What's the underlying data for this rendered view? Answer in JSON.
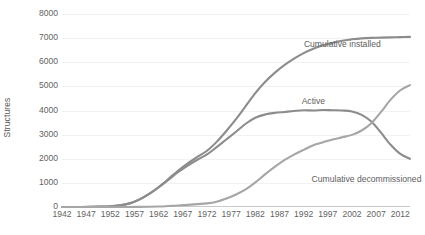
{
  "chart_data": {
    "type": "line",
    "title": "",
    "xlabel": "",
    "ylabel": "Structures",
    "xlim": [
      1942,
      2014
    ],
    "ylim": [
      0,
      8000
    ],
    "grid": true,
    "legend_position": "inline-labels",
    "y_ticks": [
      "0",
      "1000",
      "2000",
      "3000",
      "4000",
      "5000",
      "6000",
      "7000",
      "8000"
    ],
    "y_tick_values": [
      0,
      1000,
      2000,
      3000,
      4000,
      5000,
      6000,
      7000,
      8000
    ],
    "x_ticks": [
      "1942",
      "1947",
      "1952",
      "1957",
      "1962",
      "1967",
      "1972",
      "1977",
      "1982",
      "1987",
      "1992",
      "1997",
      "2002",
      "2007",
      "2012"
    ],
    "x_tick_values": [
      1942,
      1947,
      1952,
      1957,
      1962,
      1967,
      1972,
      1977,
      1982,
      1987,
      1992,
      1997,
      2002,
      2007,
      2012
    ],
    "x": [
      1942,
      1944,
      1946,
      1948,
      1950,
      1952,
      1954,
      1956,
      1958,
      1960,
      1962,
      1964,
      1966,
      1968,
      1970,
      1972,
      1974,
      1976,
      1978,
      1980,
      1982,
      1984,
      1986,
      1988,
      1990,
      1992,
      1994,
      1996,
      1998,
      2000,
      2002,
      2004,
      2006,
      2008,
      2010,
      2012,
      2014
    ],
    "series": [
      {
        "name": "Cumulative installed",
        "color": "#8c8c8c",
        "values": [
          0,
          0,
          0,
          5,
          15,
          30,
          70,
          150,
          310,
          540,
          830,
          1160,
          1500,
          1810,
          2080,
          2330,
          2700,
          3150,
          3640,
          4180,
          4720,
          5180,
          5560,
          5880,
          6150,
          6380,
          6560,
          6700,
          6810,
          6890,
          6950,
          6990,
          7010,
          7020,
          7030,
          7040,
          7050
        ],
        "label_x": 2000,
        "label_y": 6750
      },
      {
        "name": "Active",
        "color": "#8c8c8c",
        "values": [
          0,
          0,
          0,
          5,
          15,
          30,
          70,
          150,
          305,
          530,
          810,
          1120,
          1440,
          1720,
          1960,
          2180,
          2480,
          2800,
          3120,
          3450,
          3700,
          3830,
          3900,
          3940,
          3980,
          4010,
          4000,
          4020,
          4010,
          4000,
          3960,
          3820,
          3540,
          3080,
          2580,
          2200,
          2000
        ],
        "label_x": 1994,
        "label_y": 4380
      },
      {
        "name": "Cumulative decommissioned",
        "color": "#a6a6a6",
        "values": [
          0,
          0,
          0,
          0,
          0,
          0,
          0,
          0,
          5,
          10,
          20,
          40,
          60,
          90,
          120,
          150,
          220,
          350,
          520,
          730,
          1020,
          1350,
          1660,
          1940,
          2170,
          2370,
          2560,
          2680,
          2800,
          2890,
          2990,
          3170,
          3470,
          3940,
          4450,
          4840,
          5050
        ],
        "label_x": 2005,
        "label_y": 1150
      }
    ]
  }
}
